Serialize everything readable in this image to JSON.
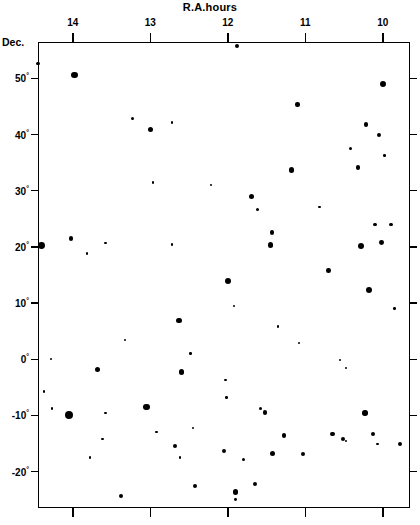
{
  "chart_data": {
    "type": "scatter",
    "title": "R.A.hours",
    "xlabel": "R.A.hours",
    "ylabel": "Dec.",
    "xlim": [
      14.45,
      9.65
    ],
    "ylim": [
      -26.5,
      56.5
    ],
    "x_reversed": true,
    "grid": false,
    "legend": null,
    "xticks": [
      14,
      13,
      12,
      11,
      10
    ],
    "xticklabels": [
      "14",
      "13",
      "12",
      "11",
      "10"
    ],
    "yticks": [
      50,
      40,
      30,
      20,
      10,
      0,
      -10,
      -20
    ],
    "yticklabels": [
      "50°",
      "40°",
      "30°",
      "20°",
      "10°",
      "0°",
      "-10°",
      "-20°"
    ],
    "marker_color": "#000000",
    "marker_size_meaning": "symbol area scales with object brightness/magnitude",
    "point_count": 77,
    "points": [
      {
        "ra": 11.88,
        "dec": 55.8,
        "size": 4.0
      },
      {
        "ra": 14.45,
        "dec": 52.6,
        "size": 3.2
      },
      {
        "ra": 13.98,
        "dec": 50.6,
        "size": 6.4
      },
      {
        "ra": 10.0,
        "dec": 49.0,
        "size": 6.6
      },
      {
        "ra": 11.1,
        "dec": 45.4,
        "size": 4.4
      },
      {
        "ra": 13.23,
        "dec": 42.8,
        "size": 3.0
      },
      {
        "ra": 13.0,
        "dec": 40.9,
        "size": 5.4
      },
      {
        "ra": 12.72,
        "dec": 42.2,
        "size": 2.6
      },
      {
        "ra": 10.22,
        "dec": 41.8,
        "size": 4.6
      },
      {
        "ra": 10.05,
        "dec": 40.0,
        "size": 4.2
      },
      {
        "ra": 10.42,
        "dec": 37.6,
        "size": 3.0
      },
      {
        "ra": 9.98,
        "dec": 36.3,
        "size": 2.4
      },
      {
        "ra": 11.18,
        "dec": 33.7,
        "size": 5.2
      },
      {
        "ra": 10.32,
        "dec": 34.1,
        "size": 4.6
      },
      {
        "ra": 12.97,
        "dec": 31.5,
        "size": 2.4
      },
      {
        "ra": 12.22,
        "dec": 31.0,
        "size": 2.2
      },
      {
        "ra": 11.7,
        "dec": 28.9,
        "size": 5.0
      },
      {
        "ra": 11.62,
        "dec": 26.7,
        "size": 3.0
      },
      {
        "ra": 10.82,
        "dec": 27.1,
        "size": 2.6
      },
      {
        "ra": 10.1,
        "dec": 24.0,
        "size": 3.6
      },
      {
        "ra": 14.4,
        "dec": 20.3,
        "size": 6.8
      },
      {
        "ra": 14.02,
        "dec": 21.5,
        "size": 4.2
      },
      {
        "ra": 13.58,
        "dec": 20.7,
        "size": 2.4
      },
      {
        "ra": 13.82,
        "dec": 18.8,
        "size": 2.4
      },
      {
        "ra": 12.72,
        "dec": 20.4,
        "size": 2.6
      },
      {
        "ra": 11.45,
        "dec": 20.3,
        "size": 5.6
      },
      {
        "ra": 11.43,
        "dec": 22.6,
        "size": 4.8
      },
      {
        "ra": 10.28,
        "dec": 20.1,
        "size": 6.2
      },
      {
        "ra": 10.02,
        "dec": 20.8,
        "size": 4.8
      },
      {
        "ra": 9.9,
        "dec": 24.0,
        "size": 3.8
      },
      {
        "ra": 12.0,
        "dec": 14.0,
        "size": 6.0
      },
      {
        "ra": 10.18,
        "dec": 12.3,
        "size": 6.4
      },
      {
        "ra": 10.7,
        "dec": 15.8,
        "size": 4.6
      },
      {
        "ra": 11.92,
        "dec": 9.5,
        "size": 2.6
      },
      {
        "ra": 9.85,
        "dec": 9.0,
        "size": 2.6
      },
      {
        "ra": 12.63,
        "dec": 6.9,
        "size": 5.2
      },
      {
        "ra": 11.35,
        "dec": 5.8,
        "size": 2.4
      },
      {
        "ra": 13.33,
        "dec": 3.4,
        "size": 2.6
      },
      {
        "ra": 11.08,
        "dec": 2.9,
        "size": 2.6
      },
      {
        "ra": 12.48,
        "dec": 1.0,
        "size": 2.4
      },
      {
        "ra": 14.28,
        "dec": 0.0,
        "size": 2.4
      },
      {
        "ra": 10.55,
        "dec": -0.2,
        "size": 2.2
      },
      {
        "ra": 13.68,
        "dec": -1.8,
        "size": 5.0
      },
      {
        "ra": 12.6,
        "dec": -2.3,
        "size": 5.4
      },
      {
        "ra": 10.48,
        "dec": -1.6,
        "size": 2.2
      },
      {
        "ra": 14.37,
        "dec": -5.7,
        "size": 2.6
      },
      {
        "ra": 12.03,
        "dec": -3.7,
        "size": 2.6
      },
      {
        "ra": 12.02,
        "dec": -6.8,
        "size": 2.4
      },
      {
        "ra": 14.27,
        "dec": -8.8,
        "size": 2.4
      },
      {
        "ra": 13.05,
        "dec": -8.5,
        "size": 6.8
      },
      {
        "ra": 14.05,
        "dec": -10.0,
        "size": 8.0
      },
      {
        "ra": 11.58,
        "dec": -8.8,
        "size": 3.2
      },
      {
        "ra": 11.52,
        "dec": -9.5,
        "size": 4.6
      },
      {
        "ra": 10.23,
        "dec": -9.6,
        "size": 5.4
      },
      {
        "ra": 11.28,
        "dec": -13.6,
        "size": 4.2
      },
      {
        "ra": 10.13,
        "dec": -13.3,
        "size": 4.4
      },
      {
        "ra": 10.07,
        "dec": -15.1,
        "size": 2.4
      },
      {
        "ra": 10.48,
        "dec": -14.6,
        "size": 2.2
      },
      {
        "ra": 12.68,
        "dec": -15.5,
        "size": 4.2
      },
      {
        "ra": 12.62,
        "dec": -17.5,
        "size": 2.6
      },
      {
        "ra": 12.05,
        "dec": -16.3,
        "size": 4.4
      },
      {
        "ra": 11.8,
        "dec": -17.9,
        "size": 3.2
      },
      {
        "ra": 11.42,
        "dec": -16.8,
        "size": 5.2
      },
      {
        "ra": 11.03,
        "dec": -16.9,
        "size": 4.0
      },
      {
        "ra": 10.65,
        "dec": -13.3,
        "size": 4.2
      },
      {
        "ra": 10.51,
        "dec": -14.2,
        "size": 4.0
      },
      {
        "ra": 9.78,
        "dec": -15.1,
        "size": 4.2
      },
      {
        "ra": 13.78,
        "dec": -17.5,
        "size": 2.6
      },
      {
        "ra": 12.45,
        "dec": -12.2,
        "size": 2.4
      },
      {
        "ra": 11.65,
        "dec": -22.2,
        "size": 4.2
      },
      {
        "ra": 11.9,
        "dec": -23.6,
        "size": 5.6
      },
      {
        "ra": 11.9,
        "dec": -25.0,
        "size": 2.8
      },
      {
        "ra": 12.43,
        "dec": -22.6,
        "size": 4.0
      },
      {
        "ra": 13.38,
        "dec": -24.3,
        "size": 4.2
      },
      {
        "ra": 13.62,
        "dec": -14.2,
        "size": 2.6
      },
      {
        "ra": 12.92,
        "dec": -13.0,
        "size": 2.4
      },
      {
        "ra": 13.58,
        "dec": -9.6,
        "size": 2.2
      }
    ]
  }
}
